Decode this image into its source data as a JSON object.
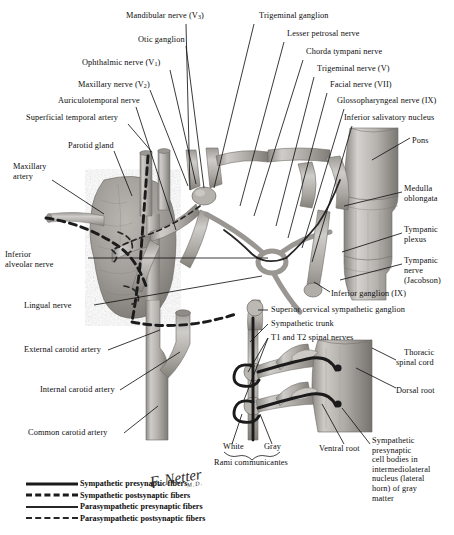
{
  "plate": {
    "title": "Autonomic innervation of the head — parotid gland, tympanic plexus and sympathetic trunk",
    "background": "#ffffff",
    "ink": "#0d0d0d",
    "tissue_light": "#c9c7c4",
    "tissue_mid": "#a8a5a1",
    "tissue_dark": "#7e7b77",
    "gland_fill": "#9c9894",
    "fiber_color": "#1b1b1b"
  },
  "labels_left": [
    {
      "text": "Maxillary nerve (V",
      "sub": "2",
      "tail": ")",
      "x": 78,
      "y": 84
    },
    {
      "text": "Auriculotemporal nerve",
      "x": 58,
      "y": 100
    },
    {
      "text": "Superficial temporal artery",
      "x": 30,
      "y": 116
    },
    {
      "text": "Parotid gland",
      "x": 70,
      "y": 144
    },
    {
      "text": "Maxillary",
      "x": 14,
      "y": 165
    },
    {
      "text": "artery",
      "x": 14,
      "y": 175
    },
    {
      "text": "Inferior",
      "x": 6,
      "y": 253
    },
    {
      "text": "alveolar nerve",
      "x": 6,
      "y": 263
    },
    {
      "text": "Lingual nerve",
      "x": 26,
      "y": 305
    },
    {
      "text": "External carotid artery",
      "x": 26,
      "y": 349
    },
    {
      "text": "Internal carotid artery",
      "x": 42,
      "y": 389
    },
    {
      "text": "Common carotid artery",
      "x": 30,
      "y": 432
    }
  ],
  "labels_top": [
    {
      "text": "Ophthalmic nerve (V",
      "sub": "1",
      "tail": ")",
      "x": 82,
      "y": 62
    },
    {
      "text": "Otic ganglion",
      "x": 138,
      "y": 40
    },
    {
      "text": "Mandibular nerve (V",
      "sub": "3",
      "tail": ")",
      "x": 126,
      "y": 15
    },
    {
      "text": "Trigeminal ganglion",
      "x": 259,
      "y": 15
    },
    {
      "text": "Lesser petrosal nerve",
      "x": 288,
      "y": 34
    },
    {
      "text": "Chorda tympani nerve",
      "x": 307,
      "y": 52
    },
    {
      "text": "Trigeminal nerve (V)",
      "x": 318,
      "y": 69
    },
    {
      "text": "Facial nerve (VII)",
      "x": 331,
      "y": 85
    },
    {
      "text": "Glossopharyngeal nerve (IX)",
      "x": 347,
      "y": 101
    },
    {
      "text": "Inferior salivatory nucleus",
      "x": 354,
      "y": 118
    }
  ],
  "labels_right": [
    {
      "text": "Pons",
      "x": 412,
      "y": 141
    },
    {
      "text": "Medulla",
      "x": 404,
      "y": 188
    },
    {
      "text": "oblongata",
      "x": 404,
      "y": 198
    },
    {
      "text": "Tympanic",
      "x": 404,
      "y": 229
    },
    {
      "text": "plexus",
      "x": 404,
      "y": 239
    },
    {
      "text": "Tympanic",
      "x": 404,
      "y": 260
    },
    {
      "text": "nerve",
      "x": 404,
      "y": 270
    },
    {
      "text": "(Jacobson)",
      "x": 404,
      "y": 280
    },
    {
      "text": "Thoracic",
      "x": 404,
      "y": 352
    },
    {
      "text": "spinal cord",
      "x": 398,
      "y": 362
    },
    {
      "text": "Dorsal root",
      "x": 398,
      "y": 390
    }
  ],
  "labels_lower": [
    {
      "text": "Inferior ganglion (IX)",
      "x": 332,
      "y": 293
    },
    {
      "text": "Superior cervical sympathetic ganglion",
      "x": 272,
      "y": 309
    },
    {
      "text": "Sympathetic trunk",
      "x": 272,
      "y": 323
    },
    {
      "text": "T1 and T2 spinal nerves",
      "x": 272,
      "y": 337
    },
    {
      "text": "White",
      "x": 224,
      "y": 446
    },
    {
      "text": "Gray",
      "x": 265,
      "y": 446
    },
    {
      "text": "Rami communicantes",
      "x": 215,
      "y": 462
    },
    {
      "text": "Ventral root",
      "x": 320,
      "y": 448
    }
  ],
  "labels_block": {
    "x": 372,
    "y": 440,
    "lines": [
      "Sympathetic",
      "presynaptic",
      "cell bodies in",
      "intermediolateral",
      "nucleus (lateral",
      "horn) of gray",
      "matter"
    ]
  },
  "legend": {
    "items": [
      {
        "style": "solid-thick",
        "label": "Sympathetic presynaptic fibers"
      },
      {
        "style": "dash-thick",
        "label": "Sympathetic postsynaptic fibers"
      },
      {
        "style": "solid-thin",
        "label": "Parasympathetic presynaptic fibers"
      },
      {
        "style": "dash-thin",
        "label": "Parasympathetic postsynaptic fibers"
      }
    ]
  },
  "signature": {
    "name": "F. Netter",
    "credential": "M.D."
  }
}
